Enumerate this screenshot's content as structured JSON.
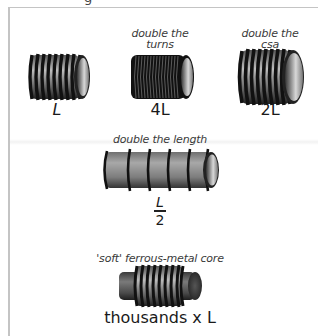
{
  "figure": {
    "clipped_top_text": "g",
    "frame_color": "#c4c4c4"
  },
  "coils": [
    {
      "id": "base",
      "caption_lines": [],
      "label": "L",
      "turns": 9,
      "style": "standard"
    },
    {
      "id": "double-turns",
      "caption_lines": [
        "double the",
        "turns"
      ],
      "label": "4L",
      "turns": 18,
      "style": "dense"
    },
    {
      "id": "double-csa",
      "caption_lines": [
        "double the",
        "csa"
      ],
      "label": "2L",
      "turns": 9,
      "style": "wide"
    },
    {
      "id": "double-length",
      "caption_lines": [
        "double the length"
      ],
      "label_fraction": {
        "numerator": "L",
        "denominator": "2"
      },
      "turns": 6,
      "style": "long"
    },
    {
      "id": "ferrous-core",
      "caption_lines": [
        "'soft' ferrous-metal core"
      ],
      "label": "thousands x L",
      "turns": 9,
      "style": "cored"
    }
  ],
  "colors": {
    "wire": "#111111",
    "wire_highlight": "#9a9a9a",
    "tube_body": "#8c8c8c",
    "tube_inner": "#cfcfcf",
    "core": "#5a5a5a"
  }
}
